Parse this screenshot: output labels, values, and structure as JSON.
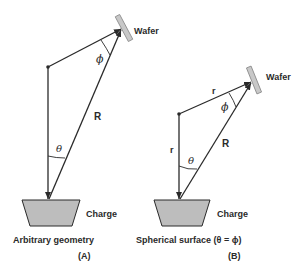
{
  "diagram": {
    "panel_a": {
      "wafer_label": "Wafer",
      "charge_label": "Charge",
      "phi_symbol": "ϕ",
      "theta_symbol": "θ",
      "r_label": "R",
      "caption": "Arbitrary geometry",
      "panel_letter": "(A)"
    },
    "panel_b": {
      "wafer_label": "Wafer",
      "charge_label": "Charge",
      "phi_symbol": "ϕ",
      "theta_symbol": "θ",
      "r_label": "R",
      "r_small_top": "r",
      "r_small_left": "r",
      "caption": "Spherical surface (θ = ϕ)",
      "panel_letter": "(B)"
    },
    "colors": {
      "line": "#2a2a2a",
      "wafer_fill": "#c8c8c8",
      "charge_fill": "#bdbdbd"
    }
  }
}
